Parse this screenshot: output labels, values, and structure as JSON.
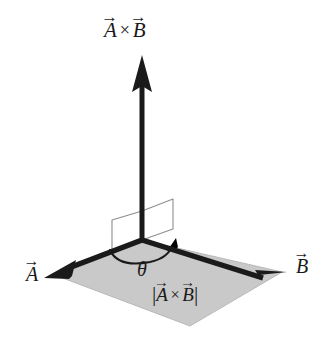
{
  "figure": {
    "background_color": "#ffffff",
    "stroke_color": "#1a1a1a",
    "plane_fill_color": "#c9c9c9",
    "plane_edge_color": "#b4b4b4",
    "right_angle_marker_color": "#8c8c8c"
  },
  "labels": {
    "cross_product": {
      "text": "A⃗ × B⃗",
      "a": "A",
      "times": "×",
      "b": "B",
      "arrow_accent": "→"
    },
    "vector_a": {
      "text": "A⃗",
      "base": "A",
      "arrow_accent": "→"
    },
    "vector_b": {
      "text": "B⃗",
      "base": "B",
      "arrow_accent": "→"
    },
    "angle": {
      "text": "θ"
    },
    "magnitude": {
      "text": "|A⃗ × B⃗|",
      "open_bar": "|",
      "a": "A",
      "times": "×",
      "b": "B",
      "close_bar": "|",
      "arrow_accent": "→"
    }
  },
  "geometry": {
    "origin": {
      "x": 142,
      "y": 240
    },
    "cross_arrow_tip": {
      "x": 142,
      "y": 55
    },
    "vector_a_tip": {
      "x": 44,
      "y": 278
    },
    "vector_b_tip": {
      "x": 287,
      "y": 272
    },
    "parallelogram_far_vertex": {
      "x": 190,
      "y": 326
    },
    "arc_sweep_degrees": 110
  }
}
